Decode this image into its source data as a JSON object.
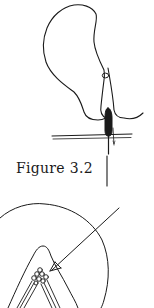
{
  "figure": {
    "caption": "Figure 3.2",
    "top_illustration": "thread-loop-with-bead-through-needle",
    "bottom_illustration": "circled-detail-of-beaded-peak-with-arrow"
  },
  "colors": {
    "ink": "#1a1a1a",
    "paper": "#ffffff"
  }
}
